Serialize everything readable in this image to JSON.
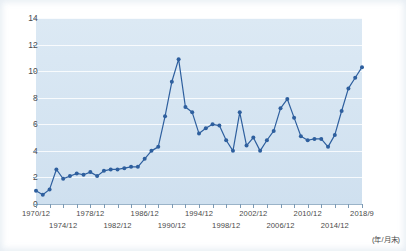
{
  "chart_data": {
    "type": "line",
    "title": "",
    "subtitle": "",
    "xlabel": "",
    "ylabel": "",
    "note": "(年/月末)",
    "grid": true,
    "legend": "none",
    "ylim": [
      0,
      14
    ],
    "yticks": [
      0,
      2,
      4,
      6,
      8,
      10,
      12,
      14
    ],
    "ytick_labels": [
      "0",
      "2",
      "4",
      "6",
      "8",
      "10",
      "12",
      "14"
    ],
    "xtick_labels_top": [
      "1970/12",
      "1978/12",
      "1986/12",
      "1994/12",
      "2002/12",
      "2010/12",
      "2018/9"
    ],
    "xtick_labels_bottom": [
      "1974/12",
      "1982/12",
      "1990/12",
      "1998/12",
      "2006/12",
      "2014/12"
    ],
    "xtick_years_top": [
      1970,
      1978,
      1986,
      1994,
      2002,
      2010,
      2018
    ],
    "xtick_years_bottom": [
      1974,
      1982,
      1990,
      1998,
      2006,
      2014
    ],
    "xlim": [
      1970,
      2018
    ],
    "series": [
      {
        "name": "series-1",
        "color": "#2e5f9e",
        "marker": "circle",
        "x": [
          1970,
          1971,
          1972,
          1973,
          1974,
          1975,
          1976,
          1977,
          1978,
          1979,
          1980,
          1981,
          1982,
          1983,
          1984,
          1985,
          1986,
          1987,
          1988,
          1989,
          1990,
          1991,
          1992,
          1993,
          1994,
          1995,
          1996,
          1997,
          1998,
          1999,
          2000,
          2001,
          2002,
          2003,
          2004,
          2005,
          2006,
          2007,
          2008,
          2009,
          2010,
          2011,
          2012,
          2013,
          2014,
          2015,
          2016,
          2017,
          2018
        ],
        "values": [
          1.0,
          0.7,
          1.1,
          2.6,
          1.9,
          2.1,
          2.3,
          2.2,
          2.4,
          2.1,
          2.5,
          2.6,
          2.6,
          2.7,
          2.8,
          2.8,
          3.4,
          4.0,
          4.3,
          6.6,
          9.2,
          10.9,
          7.3,
          6.9,
          5.3,
          5.7,
          6.0,
          5.9,
          4.8,
          4.0,
          6.9,
          4.4,
          5.0,
          4.0,
          4.8,
          5.5,
          7.2,
          7.9,
          6.5,
          5.1,
          4.8,
          4.9,
          4.9,
          4.3,
          5.2,
          7.0,
          8.7,
          9.5,
          10.3
        ]
      }
    ]
  }
}
